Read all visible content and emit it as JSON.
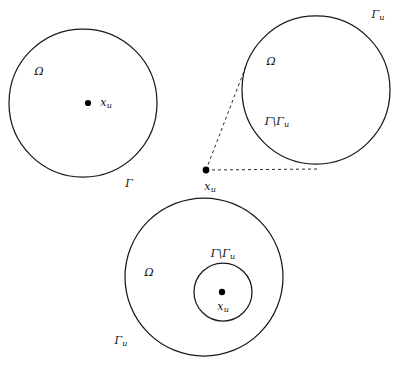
{
  "figure": {
    "background_color": "#ffffff",
    "stroke_color": "#1a1a1a",
    "dash_color": "#2a2a2a",
    "width": 403,
    "height": 365
  },
  "panels": {
    "interior": {
      "name": "source-point-inside-domain",
      "boundary_label": "Γ",
      "domain_label": "Ω",
      "point_label": "x",
      "point_sub": "u"
    },
    "exterior": {
      "name": "source-point-outside-domain",
      "boundary_label": "Γ",
      "boundary_sub": "u",
      "domain_label": "Ω",
      "complement_label": "Γ\\Γ",
      "complement_sub": "u",
      "point_label": "x",
      "point_sub": "u"
    },
    "annulus": {
      "name": "source-point-in-inner-hole",
      "outer_boundary_label": "Γ",
      "outer_boundary_sub": "u",
      "inner_boundary_label": "Γ\\Γ",
      "inner_boundary_sub": "u",
      "domain_label": "Ω",
      "point_label": "x",
      "point_sub": "u"
    }
  },
  "labels": [
    {
      "id": "omega-left",
      "text": "Ω",
      "sub": "",
      "x": 39,
      "y": 71
    },
    {
      "id": "xu-left",
      "text": "x",
      "sub": "u",
      "x": 106,
      "y": 103
    },
    {
      "id": "gamma-left",
      "text": "Γ",
      "sub": "",
      "x": 129,
      "y": 183
    },
    {
      "id": "gamma-u-topright",
      "text": "Γ",
      "sub": "u",
      "x": 378,
      "y": 15
    },
    {
      "id": "omega-topright",
      "text": "Ω",
      "sub": "",
      "x": 271,
      "y": 61
    },
    {
      "id": "gamma-diff-topright",
      "text": "Γ\\Γ",
      "sub": "u",
      "x": 277,
      "y": 122
    },
    {
      "id": "xu-middle",
      "text": "x",
      "sub": "u",
      "x": 210,
      "y": 187
    },
    {
      "id": "gamma-diff-bottom",
      "text": "Γ\\Γ",
      "sub": "u",
      "x": 223,
      "y": 254
    },
    {
      "id": "omega-bottom",
      "text": "Ω",
      "sub": "",
      "x": 149,
      "y": 272
    },
    {
      "id": "xu-bottom",
      "text": "x",
      "sub": "u",
      "x": 223,
      "y": 307
    },
    {
      "id": "gamma-u-bottom",
      "text": "Γ",
      "sub": "u",
      "x": 121,
      "y": 341
    }
  ],
  "geometry": {
    "left_circle": {
      "cx": 83,
      "cy": 103,
      "r": 74
    },
    "left_point": {
      "cx": 88,
      "cy": 103,
      "r": 3.1
    },
    "topright_circle": {
      "cx": 316,
      "cy": 90,
      "r": 74
    },
    "source_point": {
      "cx": 206,
      "cy": 170,
      "r": 3.4
    },
    "tangent_upper": {
      "x1": 206,
      "y1": 170,
      "x2": 246,
      "y2": 66
    },
    "tangent_lower": {
      "x1": 206,
      "y1": 170,
      "x2": 320,
      "y2": 169
    },
    "outer_circle": {
      "cx": 204,
      "cy": 277,
      "r": 79
    },
    "inner_circle": {
      "cx": 223,
      "cy": 292,
      "r": 29
    },
    "inner_point": {
      "cx": 222,
      "cy": 292,
      "r": 3.2
    }
  }
}
